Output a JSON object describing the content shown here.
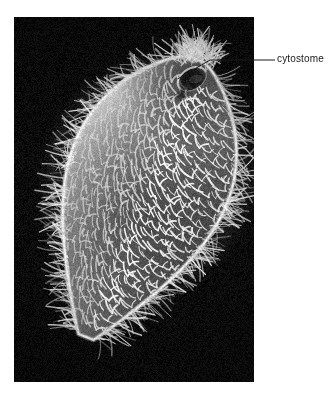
{
  "figure": {
    "domain": "Natural-Image",
    "kind": "scanning-electron-micrograph",
    "page_background": "#ffffff",
    "plate": {
      "x": 14,
      "y": 17,
      "width": 240,
      "height": 365,
      "background_color": "#0c0c0c",
      "description": "black-background scanning electron micrograph plate"
    }
  },
  "annotations": [
    {
      "id": "cytostome",
      "label": "cytostome",
      "text_color": "#1a1a1a",
      "font_size_px": 10,
      "label_x": 277,
      "label_y": 53,
      "leader": {
        "color": "#1a1a1a",
        "width": 1,
        "points": [
          [
            177.5,
            79.0
          ],
          [
            210.0,
            60.0
          ],
          [
            275.0,
            60.0
          ]
        ]
      }
    }
  ],
  "specimen": {
    "name": "ciliate cell body",
    "outline_note": "elongated teardrop / leaf shape tilted about 33 degrees, narrow apex upper-right, broad rounded base lower-left",
    "surface_note": "ridged pellicle with regular rows of cilia tufts forming chevron pattern",
    "fringe_note": "dense cilia fringe projecting beyond the body margin",
    "highlight_color": "#f2f2f2",
    "midtone_color": "#8e8e8e",
    "shadow_color": "#2a2a2a",
    "cytostome_note": "dark oval oral depression near the apex at upper right"
  }
}
